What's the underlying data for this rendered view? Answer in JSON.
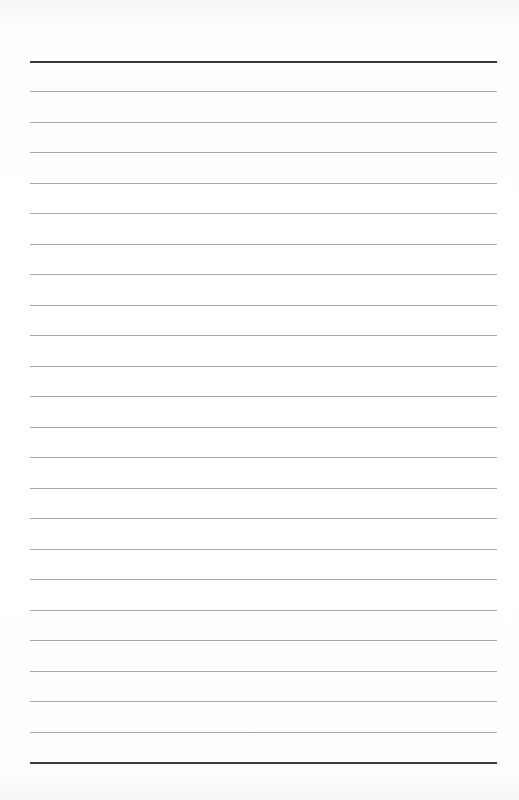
{
  "page": {
    "type": "lined-paper",
    "text": "",
    "top_rule_y": 61,
    "bottom_rule_y": 762,
    "line_spacing": 30.48,
    "thin_line_count": 22,
    "colors": {
      "thick_rule": "#3a3a3a",
      "thin_rule": "#a9a9a9",
      "paper": "#ffffff"
    }
  }
}
